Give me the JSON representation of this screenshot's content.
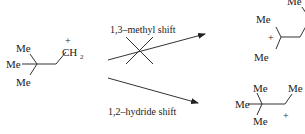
{
  "reactant": {
    "substituents": [
      "Me",
      "Me",
      "Me"
    ],
    "cation_group": "CH",
    "cation_subscript": "2",
    "charge": "+"
  },
  "pathways": [
    {
      "label": "1,3–methyl shift",
      "blocked": true,
      "product": {
        "substituents_top": "Me",
        "substituents_left_upper": "Me",
        "substituents_left_lower": "Me",
        "charge": "+"
      }
    },
    {
      "label": "1,2–hydride shift",
      "blocked": false,
      "product": {
        "substituent_top": "Me",
        "substituent_left": "Me",
        "substituent_bottom": "Me",
        "substituent_right": "Me",
        "charge": "+"
      }
    }
  ]
}
